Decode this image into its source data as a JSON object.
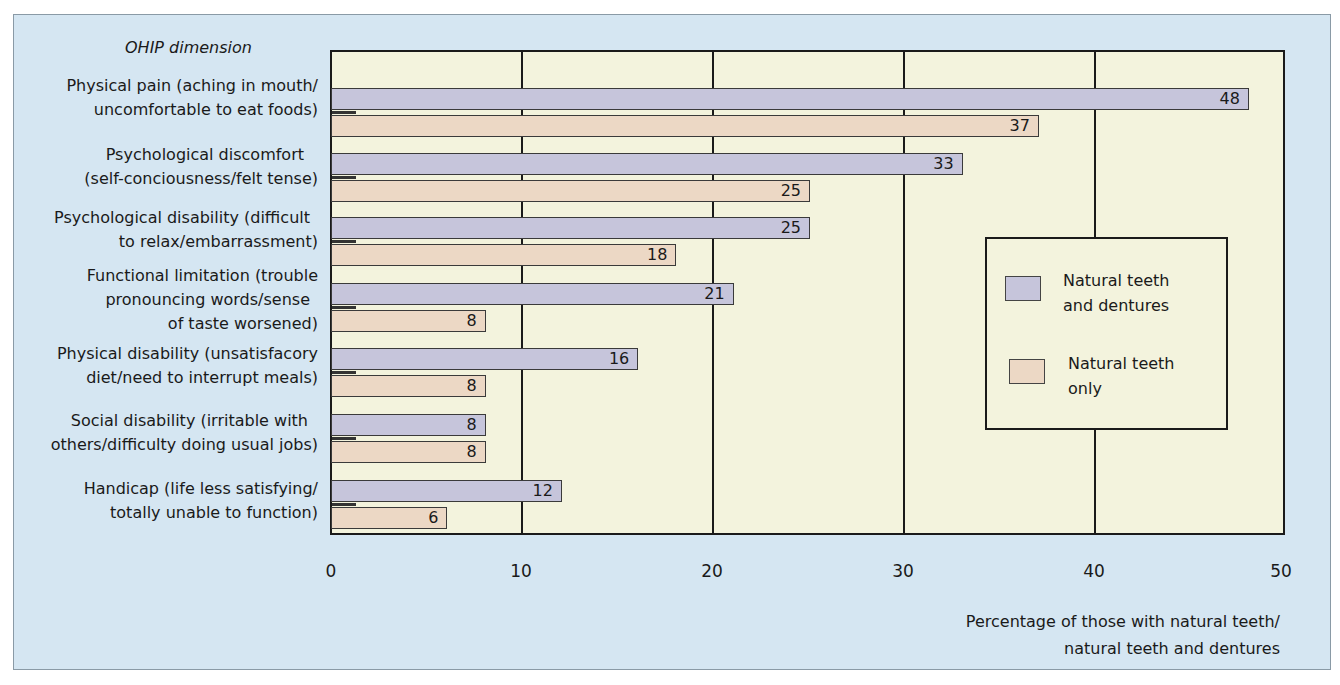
{
  "chart_data": {
    "type": "bar",
    "orientation": "horizontal",
    "title": "",
    "ylabel": "OHIP dimension",
    "xlabel": "Percentage of those with natural teeth/ natural teeth and dentures",
    "xlim": [
      0,
      50
    ],
    "xticks": [
      0,
      10,
      20,
      30,
      40,
      50
    ],
    "grid": true,
    "legend_position": "right-inside",
    "categories": [
      "Physical pain (aching in mouth/ uncomfortable to eat foods)",
      "Psychological discomfort (self-conciousness/felt tense)",
      "Psychological disability (difficult to relax/embarrassment)",
      "Functional limitation (trouble pronouncing words/sense of taste worsened)",
      "Physical disability (unsatisfacory diet/need to interrupt meals)",
      "Social disability (irritable with others/difficulty doing usual jobs)",
      "Handicap (life less satisfying/ totally unable to function)"
    ],
    "series": [
      {
        "name": "Natural teeth and dentures",
        "color": "#c6c5db",
        "values": [
          48,
          33,
          25,
          21,
          16,
          8,
          12
        ]
      },
      {
        "name": "Natural teeth only",
        "color": "#ecd8c5",
        "values": [
          37,
          25,
          18,
          8,
          8,
          8,
          6
        ]
      }
    ]
  },
  "labels": {
    "dimension_title": "OHIP dimension",
    "categories": [
      [
        "Physical pain (aching in mouth/",
        "uncomfortable to eat foods)"
      ],
      [
        "Psychological discomfort",
        "(self-conciousness/felt tense)"
      ],
      [
        "Psychological disability (difficult",
        "to relax/embarrassment)"
      ],
      [
        "Functional limitation (trouble",
        "pronouncing words/sense",
        "of taste worsened)"
      ],
      [
        "Physical disability (unsatisfacory",
        "diet/need to interrupt meals)"
      ],
      [
        "Social disability (irritable with",
        "others/difficulty doing usual jobs)"
      ],
      [
        "Handicap (life less satisfying/",
        "totally unable to function)"
      ]
    ],
    "xticks": [
      "0",
      "10",
      "20",
      "30",
      "40",
      "50"
    ],
    "xlabel_lines": [
      "Percentage of those with natural teeth/",
      "natural teeth and dentures"
    ],
    "legend": [
      [
        "Natural teeth",
        "and dentures"
      ],
      [
        "Natural teeth",
        "only"
      ]
    ]
  },
  "colors": {
    "panel_bg": "#d5e6f2",
    "plot_bg": "#f3f3dd",
    "series_1": "#c6c5db",
    "series_2": "#ecd8c5"
  }
}
